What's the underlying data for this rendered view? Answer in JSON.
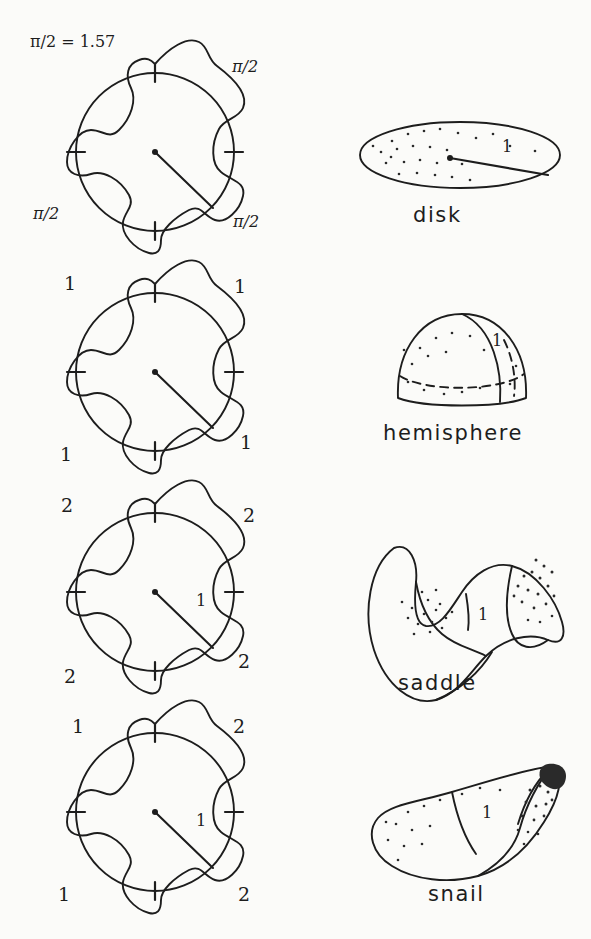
{
  "figure": {
    "title_note": "π/2 = 1.57",
    "background_color": "#fbfbf9",
    "ink_color": "#1d1d1d",
    "radius_label": "1"
  },
  "rows": [
    {
      "id": "row-disk",
      "flower": {
        "name": "flower-disk",
        "corner_labels": {
          "top_left": "π/2 = 1.57",
          "top_right": "π/2",
          "bottom_left": "π/2",
          "bottom_right": "π/2"
        },
        "radius_label": "",
        "petal_count": 8,
        "tick_count": 4
      },
      "surface": {
        "name": "disk",
        "caption": "disk",
        "radius_label": "1"
      }
    },
    {
      "id": "row-hemisphere",
      "flower": {
        "name": "flower-hemisphere",
        "corner_labels": {
          "top_left": "1",
          "top_right": "1",
          "bottom_left": "1",
          "bottom_right": "1"
        },
        "radius_label": "",
        "petal_count": 8,
        "tick_count": 4
      },
      "surface": {
        "name": "hemisphere",
        "caption": "hemisphere",
        "radius_label": "1"
      }
    },
    {
      "id": "row-saddle",
      "flower": {
        "name": "flower-saddle",
        "corner_labels": {
          "top_left": "2",
          "top_right": "2",
          "bottom_left": "2",
          "bottom_right": "2"
        },
        "radius_label": "1",
        "petal_count": 8,
        "tick_count": 4
      },
      "surface": {
        "name": "saddle",
        "caption": "saddle",
        "radius_label": "1"
      }
    },
    {
      "id": "row-snail",
      "flower": {
        "name": "flower-snail",
        "corner_labels": {
          "top_left": "1",
          "top_right": "2",
          "bottom_left": "1",
          "bottom_right": "2"
        },
        "radius_label": "1",
        "petal_count": 8,
        "tick_count": 4
      },
      "surface": {
        "name": "snail",
        "caption": "snail",
        "radius_label": "1"
      }
    }
  ]
}
